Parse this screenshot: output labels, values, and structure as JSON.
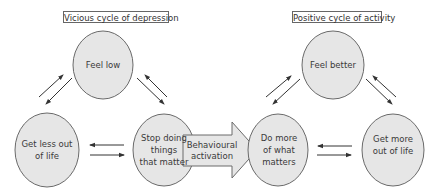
{
  "colors": {
    "node_fill": "#e6e6e6",
    "node_stroke": "#6a6a6a",
    "arrow": "#333333",
    "text": "#3a3a3a"
  },
  "vicious_cycle": {
    "title": "Vicious cycle of depression",
    "nodes": [
      {
        "id": "feel-low",
        "label": "Feel low"
      },
      {
        "id": "get-less-out-of-life",
        "label": "Get less out\nof life"
      },
      {
        "id": "stop-doing-things",
        "label": "Stop doing\nthings\nthat matter"
      }
    ]
  },
  "bridge": {
    "label": "Behavioural\nactivation"
  },
  "positive_cycle": {
    "title": "Positive cycle of activity",
    "nodes": [
      {
        "id": "feel-better",
        "label": "Feel better"
      },
      {
        "id": "do-more",
        "label": "Do more\nof what\nmatters"
      },
      {
        "id": "get-more-out-of-life",
        "label": "Get more\nout of life"
      }
    ]
  }
}
